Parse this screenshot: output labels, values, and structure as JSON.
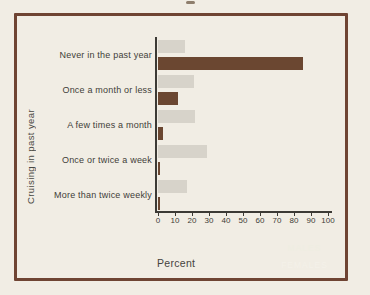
{
  "figure": {
    "y_axis_label": "Cruising in past year",
    "x_axis_label": "Percent"
  },
  "legend": {
    "males_label": "MALES",
    "females_label": "FEMALES"
  },
  "colors": {
    "background": "#f1ede4",
    "frame_border": "#6f4433",
    "males_bar": "#d7d3ca",
    "females_bar": "#6b4731",
    "axis": "#3c3a35",
    "text": "#3f3d38"
  },
  "chart_data": {
    "type": "bar",
    "orientation": "horizontal",
    "title": "",
    "xlabel": "Percent",
    "ylabel": "Cruising in past year",
    "xlim": [
      0,
      100
    ],
    "xticks": [
      0,
      10,
      20,
      30,
      40,
      50,
      60,
      70,
      80,
      90,
      100
    ],
    "grid": false,
    "legend_position": "bottom-right",
    "categories": [
      "Never in the past year",
      "Once a month or less",
      "A few times a month",
      "Once or twice a week",
      "More than twice weekly"
    ],
    "series": [
      {
        "name": "MALES",
        "values": [
          16,
          21,
          22,
          29,
          17
        ]
      },
      {
        "name": "FEMALES",
        "values": [
          85,
          12,
          3,
          1,
          1
        ]
      }
    ]
  }
}
